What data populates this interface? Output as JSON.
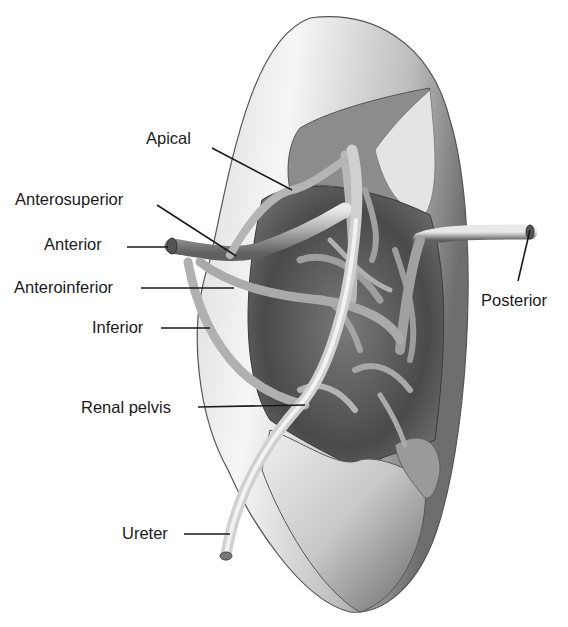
{
  "figure": {
    "style": "grayscale pencil illustration"
  },
  "labels": {
    "apical": "Apical",
    "anterosuperior": "Anterosuperior",
    "anterior": "Anterior",
    "anteroinferior": "Anteroinferior",
    "inferior": "Inferior",
    "renal_pelvis": "Renal pelvis",
    "ureter": "Ureter",
    "posterior": "Posterior"
  }
}
